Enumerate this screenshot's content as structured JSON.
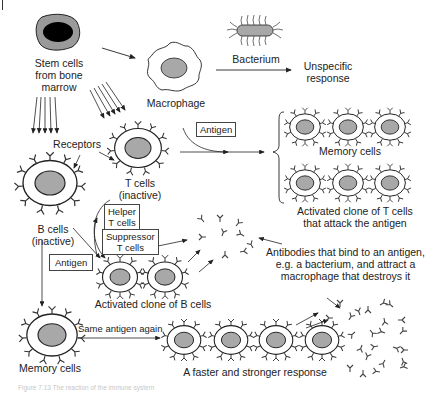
{
  "labels": {
    "stem_cells": [
      "Stem cells",
      "from bone",
      "marrow"
    ],
    "bacterium": "Bacterium",
    "macrophage": "Macrophage",
    "unspecific_response": [
      "Unspecific",
      "response"
    ],
    "receptors": "Receptors",
    "t_cells_inactive": [
      "T cells",
      "(inactive)"
    ],
    "b_cells_inactive": [
      "B cells",
      "(inactive)"
    ],
    "memory_cells_top": "Memory cells",
    "activated_t_clone": [
      "Activated clone of T cells",
      "that attack the antigen"
    ],
    "activated_b_clone": "Activated clone of B cells",
    "antibodies_note": [
      "Antibodies that bind to an antigen,",
      "e.g. a bacterium, and attract a",
      "macrophage that destroys it"
    ],
    "memory_cells_bottom": "Memory cells",
    "same_antigen_again": "Same antigen again",
    "faster_response": "A faster and stronger response"
  },
  "boxes": {
    "antigen_top": "Antigen",
    "helper_t": [
      "Helper",
      "T cells"
    ],
    "suppressor_t": [
      "Suppressor",
      "T cells"
    ],
    "antigen_left": "Antigen"
  },
  "caption": "Figure 7.13  The reaction of the immune system",
  "colors": {
    "line": "#222222",
    "nucleus_fill": "#a8a8a8",
    "stem_cell_body": "#9a9a9a",
    "stem_nucleus": "#000000"
  }
}
